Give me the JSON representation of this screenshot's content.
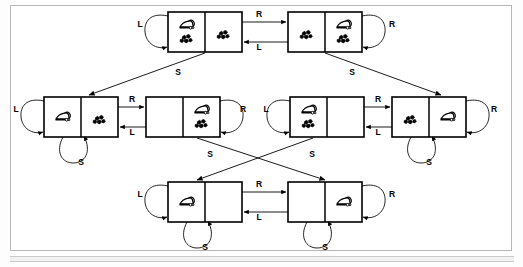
{
  "figure": {
    "frame": {
      "border_color": "#b6b6b6",
      "background": "#ffffff"
    },
    "line_color": "#000000",
    "loop_color": "#1a1a1a"
  },
  "legend": {
    "actions": [
      {
        "key": "L",
        "label": "L",
        "meaning": "Left"
      },
      {
        "key": "R",
        "label": "R",
        "meaning": "Right"
      },
      {
        "key": "S",
        "label": "S",
        "meaning": "Suck"
      }
    ]
  },
  "icons": {
    "vacuum": "vacuum-cleaner-icon",
    "dirt": "dirt-icon"
  },
  "states": [
    {
      "id": "s1",
      "row": "top",
      "position": "left",
      "x": 168,
      "y": 12,
      "w": 74,
      "h": 40,
      "cells": [
        {
          "side": "left",
          "agent": true,
          "dirt": true
        },
        {
          "side": "right",
          "agent": false,
          "dirt": true
        }
      ]
    },
    {
      "id": "s2",
      "row": "top",
      "position": "right",
      "x": 288,
      "y": 12,
      "w": 74,
      "h": 40,
      "cells": [
        {
          "side": "left",
          "agent": false,
          "dirt": true
        },
        {
          "side": "right",
          "agent": true,
          "dirt": true
        }
      ]
    },
    {
      "id": "s3",
      "row": "middle",
      "position": "far-left",
      "x": 44,
      "y": 97,
      "w": 74,
      "h": 40,
      "cells": [
        {
          "side": "left",
          "agent": true,
          "dirt": false
        },
        {
          "side": "right",
          "agent": false,
          "dirt": true
        }
      ]
    },
    {
      "id": "s4",
      "row": "middle",
      "position": "left-inner",
      "x": 146,
      "y": 97,
      "w": 74,
      "h": 40,
      "cells": [
        {
          "side": "left",
          "agent": false,
          "dirt": false
        },
        {
          "side": "right",
          "agent": true,
          "dirt": true
        }
      ]
    },
    {
      "id": "s5",
      "row": "middle",
      "position": "right-inner",
      "x": 290,
      "y": 97,
      "w": 74,
      "h": 40,
      "cells": [
        {
          "side": "left",
          "agent": true,
          "dirt": true
        },
        {
          "side": "right",
          "agent": false,
          "dirt": false
        }
      ]
    },
    {
      "id": "s6",
      "row": "middle",
      "position": "far-right",
      "x": 392,
      "y": 97,
      "w": 74,
      "h": 40,
      "cells": [
        {
          "side": "left",
          "agent": false,
          "dirt": true
        },
        {
          "side": "right",
          "agent": true,
          "dirt": false
        }
      ]
    },
    {
      "id": "s7",
      "row": "bottom",
      "position": "left",
      "x": 168,
      "y": 182,
      "w": 74,
      "h": 40,
      "cells": [
        {
          "side": "left",
          "agent": true,
          "dirt": false
        },
        {
          "side": "right",
          "agent": false,
          "dirt": false
        }
      ]
    },
    {
      "id": "s8",
      "row": "bottom",
      "position": "right",
      "x": 288,
      "y": 182,
      "w": 74,
      "h": 40,
      "cells": [
        {
          "side": "left",
          "agent": false,
          "dirt": false
        },
        {
          "side": "right",
          "agent": true,
          "dirt": false
        }
      ]
    }
  ],
  "transitions": [
    {
      "id": "t1",
      "from": "s1",
      "to": "s2",
      "action": "R",
      "kind": "straight",
      "label_x": 259,
      "label_y": 15
    },
    {
      "id": "t2",
      "from": "s2",
      "to": "s1",
      "action": "L",
      "kind": "straight",
      "label_x": 259,
      "label_y": 48
    },
    {
      "id": "t3",
      "from": "s3",
      "to": "s4",
      "action": "R",
      "kind": "straight",
      "label_x": 132,
      "label_y": 100
    },
    {
      "id": "t4",
      "from": "s4",
      "to": "s3",
      "action": "L",
      "kind": "straight",
      "label_x": 132,
      "label_y": 133
    },
    {
      "id": "t5",
      "from": "s5",
      "to": "s6",
      "action": "R",
      "kind": "straight",
      "label_x": 378,
      "label_y": 100
    },
    {
      "id": "t6",
      "from": "s6",
      "to": "s5",
      "action": "L",
      "kind": "straight",
      "label_x": 378,
      "label_y": 133
    },
    {
      "id": "t7",
      "from": "s7",
      "to": "s8",
      "action": "R",
      "kind": "straight",
      "label_x": 259,
      "label_y": 185
    },
    {
      "id": "t8",
      "from": "s8",
      "to": "s7",
      "action": "L",
      "kind": "straight",
      "label_x": 259,
      "label_y": 218
    },
    {
      "id": "t9",
      "from": "s1",
      "to": "s3",
      "action": "S",
      "kind": "diagonal",
      "label_x": 178,
      "label_y": 73
    },
    {
      "id": "t10",
      "from": "s2",
      "to": "s6",
      "action": "S",
      "kind": "diagonal",
      "label_x": 352,
      "label_y": 73
    },
    {
      "id": "t11",
      "from": "s4",
      "to": "s8",
      "action": "S",
      "kind": "diagonal",
      "label_x": 312,
      "label_y": 155
    },
    {
      "id": "t12",
      "from": "s5",
      "to": "s7",
      "action": "S",
      "kind": "diagonal",
      "label_x": 210,
      "label_y": 155
    }
  ],
  "self_loops": [
    {
      "id": "l1",
      "state": "s1",
      "action": "L",
      "side": "left",
      "label_x": 140,
      "label_y": 25
    },
    {
      "id": "l2",
      "state": "s2",
      "action": "R",
      "side": "right",
      "label_x": 392,
      "label_y": 25
    },
    {
      "id": "l3",
      "state": "s3",
      "action": "L",
      "side": "left",
      "label_x": 16,
      "label_y": 110
    },
    {
      "id": "l4",
      "state": "s3",
      "action": "S",
      "side": "bottom",
      "label_x": 81,
      "label_y": 163
    },
    {
      "id": "l5",
      "state": "s4",
      "action": "R",
      "side": "right",
      "label_x": 243,
      "label_y": 110
    },
    {
      "id": "l6",
      "state": "s5",
      "action": "L",
      "side": "left",
      "label_x": 266,
      "label_y": 110
    },
    {
      "id": "l7",
      "state": "s6",
      "action": "R",
      "side": "right",
      "label_x": 494,
      "label_y": 110
    },
    {
      "id": "l8",
      "state": "s6",
      "action": "S",
      "side": "bottom",
      "label_x": 429,
      "label_y": 163
    },
    {
      "id": "l9",
      "state": "s7",
      "action": "L",
      "side": "left",
      "label_x": 140,
      "label_y": 195
    },
    {
      "id": "l10",
      "state": "s7",
      "action": "S",
      "side": "bottom",
      "label_x": 205,
      "label_y": 248
    },
    {
      "id": "l11",
      "state": "s8",
      "action": "R",
      "side": "right",
      "label_x": 392,
      "label_y": 195
    },
    {
      "id": "l12",
      "state": "s8",
      "action": "S",
      "side": "bottom",
      "label_x": 325,
      "label_y": 248
    }
  ]
}
